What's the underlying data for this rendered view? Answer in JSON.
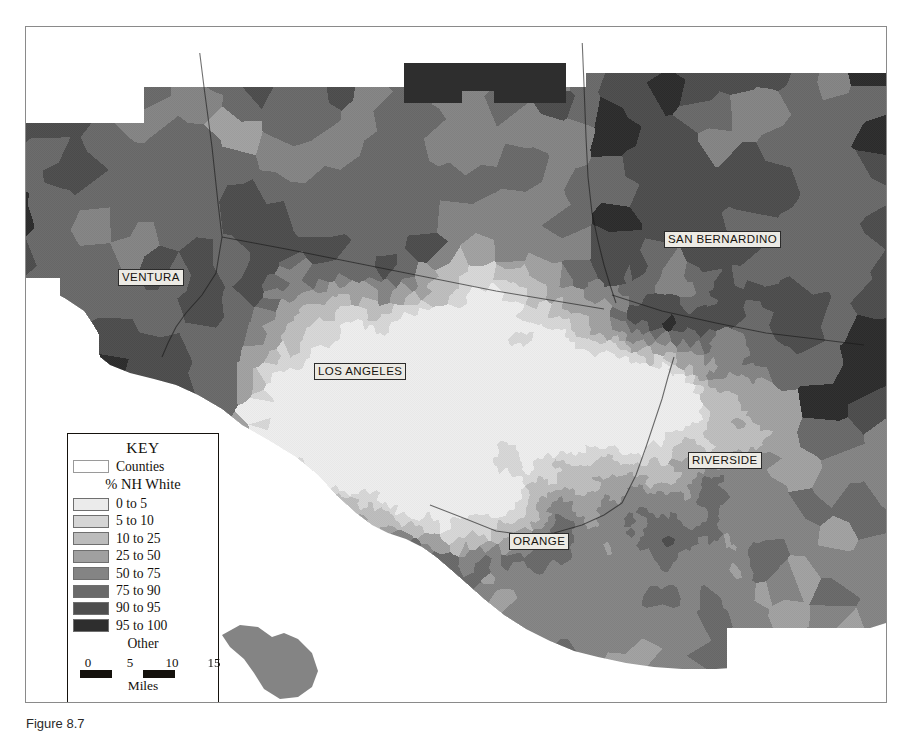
{
  "figure": {
    "caption": "Figure 8.7"
  },
  "map": {
    "background_color": "#ffffff",
    "ocean_color": "#ffffff",
    "frame_color": "#8a8a8a",
    "county_labels": [
      {
        "name": "VENTURA",
        "text": "VENTURA",
        "x": 92,
        "y": 242
      },
      {
        "name": "LOS ANGELES",
        "text": "LOS ANGELES",
        "x": 288,
        "y": 336
      },
      {
        "name": "SAN BERNARDINO",
        "text": "SAN BERNARDINO",
        "x": 638,
        "y": 204
      },
      {
        "name": "RIVERSIDE",
        "text": "RIVERSIDE",
        "x": 662,
        "y": 425
      },
      {
        "name": "ORANGE",
        "text": "ORANGE",
        "x": 483,
        "y": 506
      }
    ]
  },
  "legend": {
    "title": "KEY",
    "counties_label": "Counties",
    "subtitle": "% NH White",
    "classes": [
      {
        "label": "0 to 5",
        "color": "#ebebeb"
      },
      {
        "label": "5 to 10",
        "color": "#d5d5d5"
      },
      {
        "label": "10 to 25",
        "color": "#bcbcbc"
      },
      {
        "label": "25 to 50",
        "color": "#a0a0a0"
      },
      {
        "label": "50 to 75",
        "color": "#848484"
      },
      {
        "label": "75 to 90",
        "color": "#6a6a6a"
      },
      {
        "label": "90 to 95",
        "color": "#4e4e4e"
      },
      {
        "label": "95 to 100",
        "color": "#2e2e2e"
      }
    ],
    "other_label": "Other",
    "scale": {
      "ticks": [
        "0",
        "5",
        "10",
        "15"
      ],
      "units": "Miles"
    }
  },
  "chart_data": {
    "type": "map",
    "variable": "% NH White",
    "region": "Southern California (Los Angeles metropolitan area)",
    "counties": [
      "VENTURA",
      "LOS ANGELES",
      "SAN BERNARDINO",
      "RIVERSIDE",
      "ORANGE"
    ],
    "class_breaks": [
      0,
      5,
      10,
      25,
      50,
      75,
      90,
      95,
      100
    ],
    "class_labels": [
      "0 to 5",
      "5 to 10",
      "10 to 25",
      "25 to 50",
      "50 to 75",
      "75 to 90",
      "90 to 95",
      "95 to 100"
    ],
    "class_colors": [
      "#ebebeb",
      "#d5d5d5",
      "#bcbcbc",
      "#a0a0a0",
      "#848484",
      "#6a6a6a",
      "#4e4e4e",
      "#2e2e2e"
    ],
    "extra_category": "Other",
    "scale_bar_ticks": [
      0,
      5,
      10,
      15
    ],
    "scale_bar_units": "Miles",
    "legend_position": "lower-left"
  }
}
